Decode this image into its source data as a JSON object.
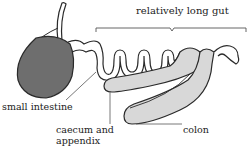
{
  "diagram": {
    "labels": {
      "gut": "relatively long gut",
      "small_intestine": "small intestine",
      "caecum": "caecum and\nappendix",
      "colon": "colon"
    },
    "colors": {
      "stomach_fill": "#6e6e6e",
      "intestine_fill": "#d8d8d8",
      "outline": "#2a2a2a",
      "leader_line": "#555555",
      "background": "#ffffff"
    }
  }
}
